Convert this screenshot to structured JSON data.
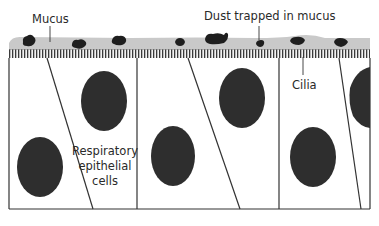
{
  "diagram": {
    "labels": {
      "mucus": "Mucus",
      "dust": "Dust trapped in mucus",
      "cilia": "Cilia",
      "cells_line1": "Respiratory",
      "cells_line2": "epithelial",
      "cells_line3": "cells"
    },
    "colors": {
      "background": "#ffffff",
      "mucus": "#c9c9c9",
      "cilia": "#3a3a3a",
      "outline": "#333333",
      "nucleus": "#2e2e2e",
      "dust": "#1e1e1e",
      "text": "#2a2a2a"
    },
    "cell_count_visible": 6,
    "dust_particle_count": 8
  }
}
